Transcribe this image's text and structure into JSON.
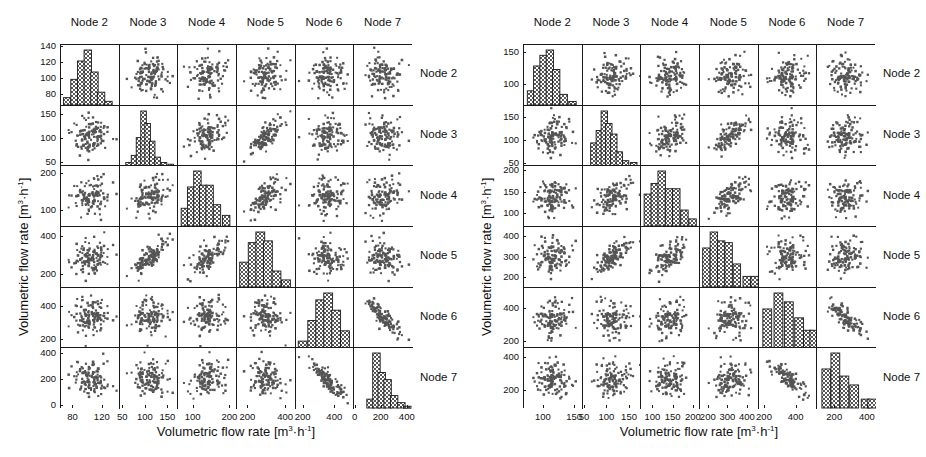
{
  "figure": {
    "axis_label_x": "Volumetric flow rate [m³·h⁻¹]",
    "axis_label_y": "Volumetric flow rate [m³·h⁻¹]",
    "nodes": [
      "Node 2",
      "Node 3",
      "Node 4",
      "Node 5",
      "Node 6",
      "Node 7"
    ],
    "marker_color": "#4d4d4d",
    "axis_color": "#1a1a1a",
    "hist_fill": "#6b6b6b"
  },
  "chart_data": [
    {
      "id": "panel-left",
      "type": "scatter",
      "title": "",
      "subtitle": "Scatter plot matrix of volumetric flow rate at Nodes 2-7 (case A)",
      "xlabel": "Volumetric flow rate [m³·h⁻¹]",
      "ylabel": "Volumetric flow rate [m³·h⁻¹]",
      "grid": false,
      "legend": "none",
      "variables": [
        "Node 2",
        "Node 3",
        "Node 4",
        "Node 5",
        "Node 6",
        "Node 7"
      ],
      "column_headers": [
        "Node 2",
        "Node 3",
        "Node 4",
        "Node 5",
        "Node 6",
        "Node 7"
      ],
      "row_headers": [
        "Node 2",
        "Node 3",
        "Node 4",
        "Node 5",
        "Node 6",
        "Node 7"
      ],
      "axis_ranges": [
        {
          "var": "Node 2",
          "xlim": [
            63,
            143
          ],
          "ylim": [
            66,
            143
          ],
          "xticks": [
            80,
            120
          ],
          "yticks": [
            80,
            100,
            120,
            140
          ]
        },
        {
          "var": "Node 3",
          "xlim": [
            42,
            172
          ],
          "ylim": [
            44,
            170
          ],
          "xticks": [
            50,
            100,
            150
          ],
          "yticks": [
            50,
            100,
            150
          ]
        },
        {
          "var": "Node 4",
          "xlim": [
            58,
            218
          ],
          "ylim": [
            58,
            220
          ],
          "xticks": [
            100,
            200
          ],
          "yticks": [
            100,
            200
          ]
        },
        {
          "var": "Node 5",
          "xlim": [
            140,
            450
          ],
          "ylim": [
            135,
            450
          ],
          "xticks": [
            200,
            400
          ],
          "yticks": [
            200,
            400
          ]
        },
        {
          "var": "Node 6",
          "xlim": [
            150,
            520
          ],
          "ylim": [
            150,
            520
          ],
          "xticks": [
            200,
            400
          ],
          "yticks": [
            200,
            400
          ]
        },
        {
          "var": "Node 7",
          "xlim": [
            -10,
            440
          ],
          "ylim": [
            -20,
            440
          ],
          "xticks": [
            0,
            200,
            400
          ],
          "yticks": [
            0,
            200,
            400
          ]
        }
      ],
      "diagonal_histograms": [
        {
          "var": "Node 2",
          "bin_centers": [
            72,
            82,
            91,
            100,
            109,
            118,
            128
          ],
          "counts": [
            4,
            14,
            24,
            30,
            18,
            7,
            2
          ]
        },
        {
          "var": "Node 3",
          "bin_centers": [
            62,
            74,
            85,
            95,
            104,
            114,
            126,
            140,
            155
          ],
          "counts": [
            2,
            6,
            16,
            31,
            24,
            14,
            5,
            2,
            1
          ]
        },
        {
          "var": "Node 4",
          "bin_centers": [
            78,
            95,
            112,
            128,
            145,
            165,
            190
          ],
          "counts": [
            10,
            22,
            31,
            23,
            23,
            12,
            6
          ]
        },
        {
          "var": "Node 5",
          "bin_centers": [
            180,
            225,
            265,
            305,
            350,
            400
          ],
          "counts": [
            14,
            25,
            31,
            26,
            9,
            4
          ]
        },
        {
          "var": "Node 6",
          "bin_centers": [
            195,
            255,
            305,
            355,
            405,
            460
          ],
          "counts": [
            4,
            16,
            28,
            32,
            22,
            10
          ]
        },
        {
          "var": "Node 7",
          "bin_centers": [
            120,
            165,
            205,
            250,
            300,
            355,
            400
          ],
          "counts": [
            5,
            31,
            20,
            16,
            7,
            3,
            1
          ]
        }
      ],
      "pair_correlations": [
        {
          "x": "Node 2",
          "y": "Node 3",
          "r": 0.05
        },
        {
          "x": "Node 2",
          "y": "Node 4",
          "r": 0.08
        },
        {
          "x": "Node 2",
          "y": "Node 5",
          "r": 0.04
        },
        {
          "x": "Node 2",
          "y": "Node 6",
          "r": 0.02
        },
        {
          "x": "Node 2",
          "y": "Node 7",
          "r": -0.1
        },
        {
          "x": "Node 3",
          "y": "Node 4",
          "r": 0.42
        },
        {
          "x": "Node 3",
          "y": "Node 5",
          "r": 0.78
        },
        {
          "x": "Node 3",
          "y": "Node 6",
          "r": -0.05
        },
        {
          "x": "Node 3",
          "y": "Node 7",
          "r": 0.03
        },
        {
          "x": "Node 4",
          "y": "Node 5",
          "r": 0.62
        },
        {
          "x": "Node 4",
          "y": "Node 6",
          "r": 0.06
        },
        {
          "x": "Node 4",
          "y": "Node 7",
          "r": 0.12
        },
        {
          "x": "Node 5",
          "y": "Node 6",
          "r": 0.02
        },
        {
          "x": "Node 5",
          "y": "Node 7",
          "r": -0.08
        },
        {
          "x": "Node 6",
          "y": "Node 7",
          "r": -0.86
        }
      ],
      "n_points": 120
    },
    {
      "id": "panel-right",
      "type": "scatter",
      "title": "",
      "subtitle": "Scatter plot matrix of volumetric flow rate at Nodes 2-7 (case B)",
      "xlabel": "Volumetric flow rate [m³·h⁻¹]",
      "ylabel": "Volumetric flow rate [m³·h⁻¹]",
      "grid": false,
      "legend": "none",
      "variables": [
        "Node 2",
        "Node 3",
        "Node 4",
        "Node 5",
        "Node 6",
        "Node 7"
      ],
      "column_headers": [
        "Node 2",
        "Node 3",
        "Node 4",
        "Node 5",
        "Node 6",
        "Node 7"
      ],
      "row_headers": [
        "Node 2",
        "Node 3",
        "Node 4",
        "Node 5",
        "Node 6",
        "Node 7"
      ],
      "axis_ranges": [
        {
          "var": "Node 2",
          "xlim": [
            68,
            162
          ],
          "ylim": [
            68,
            162
          ],
          "xticks": [
            100,
            150
          ],
          "yticks": [
            100,
            150
          ]
        },
        {
          "var": "Node 3",
          "xlim": [
            45,
            175
          ],
          "ylim": [
            45,
            178
          ],
          "xticks": [
            50,
            100,
            150
          ],
          "yticks": [
            50,
            100,
            150
          ]
        },
        {
          "var": "Node 4",
          "xlim": [
            70,
            215
          ],
          "ylim": [
            70,
            212
          ],
          "xticks": [
            100,
            150,
            200
          ],
          "yticks": [
            100,
            150,
            200
          ]
        },
        {
          "var": "Node 5",
          "xlim": [
            155,
            455
          ],
          "ylim": [
            155,
            450
          ],
          "xticks": [
            200,
            300,
            400
          ],
          "yticks": [
            200,
            300,
            400
          ]
        },
        {
          "var": "Node 6",
          "xlim": [
            160,
            530
          ],
          "ylim": [
            160,
            530
          ],
          "xticks": [
            200,
            400
          ],
          "yticks": [
            200,
            400
          ]
        },
        {
          "var": "Node 7",
          "xlim": [
            90,
            450
          ],
          "ylim": [
            95,
            455
          ],
          "xticks": [
            200,
            400
          ],
          "yticks": [
            200,
            400
          ]
        }
      ],
      "diagonal_histograms": [
        {
          "var": "Node 2",
          "bin_centers": [
            80,
            90,
            100,
            110,
            120,
            132,
            146
          ],
          "counts": [
            8,
            22,
            28,
            31,
            20,
            6,
            2
          ]
        },
        {
          "var": "Node 3",
          "bin_centers": [
            70,
            82,
            93,
            103,
            114,
            126,
            140,
            158
          ],
          "counts": [
            13,
            20,
            31,
            24,
            18,
            8,
            3,
            2
          ]
        },
        {
          "var": "Node 4",
          "bin_centers": [
            88,
            105,
            122,
            140,
            158,
            178,
            198
          ],
          "counts": [
            18,
            24,
            31,
            21,
            21,
            9,
            4
          ]
        },
        {
          "var": "Node 5",
          "bin_centers": [
            190,
            228,
            265,
            303,
            345,
            395,
            435
          ],
          "counts": [
            22,
            31,
            26,
            25,
            13,
            6,
            6
          ]
        },
        {
          "var": "Node 6",
          "bin_centers": [
            215,
            285,
            350,
            415,
            470,
            510
          ],
          "counts": [
            22,
            31,
            26,
            17,
            10,
            10
          ]
        },
        {
          "var": "Node 7",
          "bin_centers": [
            150,
            205,
            260,
            320,
            390,
            430
          ],
          "counts": [
            22,
            31,
            18,
            13,
            5,
            5
          ]
        }
      ],
      "pair_correlations": [
        {
          "x": "Node 2",
          "y": "Node 3",
          "r": 0.06
        },
        {
          "x": "Node 2",
          "y": "Node 4",
          "r": 0.1
        },
        {
          "x": "Node 2",
          "y": "Node 5",
          "r": 0.05
        },
        {
          "x": "Node 2",
          "y": "Node 6",
          "r": 0.03
        },
        {
          "x": "Node 2",
          "y": "Node 7",
          "r": -0.08
        },
        {
          "x": "Node 3",
          "y": "Node 4",
          "r": 0.45
        },
        {
          "x": "Node 3",
          "y": "Node 5",
          "r": 0.76
        },
        {
          "x": "Node 3",
          "y": "Node 6",
          "r": -0.04
        },
        {
          "x": "Node 3",
          "y": "Node 7",
          "r": 0.05
        },
        {
          "x": "Node 4",
          "y": "Node 5",
          "r": 0.6
        },
        {
          "x": "Node 4",
          "y": "Node 6",
          "r": 0.05
        },
        {
          "x": "Node 4",
          "y": "Node 7",
          "r": 0.1
        },
        {
          "x": "Node 5",
          "y": "Node 6",
          "r": 0.03
        },
        {
          "x": "Node 5",
          "y": "Node 7",
          "r": -0.06
        },
        {
          "x": "Node 6",
          "y": "Node 7",
          "r": -0.84
        }
      ],
      "n_points": 120
    }
  ]
}
